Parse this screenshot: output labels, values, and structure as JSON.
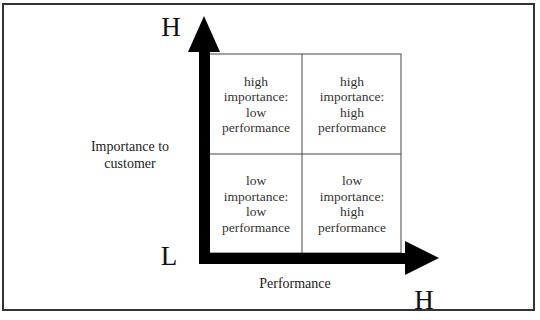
{
  "diagram": {
    "type": "2x2 importance-performance matrix",
    "y_axis": {
      "label": "Importance to\ncustomer",
      "high_marker": "H",
      "low_marker": "L"
    },
    "x_axis": {
      "label": "Performance",
      "high_marker": "H"
    },
    "quadrants": {
      "top_left": "high\nimportance:\nlow\nperformance",
      "top_right": "high\nimportance:\nhigh\nperformance",
      "bottom_left": "low\nimportance:\nlow\nperformance",
      "bottom_right": "low\nimportance:\nhigh\nperformance"
    },
    "colors": {
      "arrow": "#000000",
      "grid_line": "#444444",
      "text": "#222222",
      "border": "#333333"
    }
  }
}
